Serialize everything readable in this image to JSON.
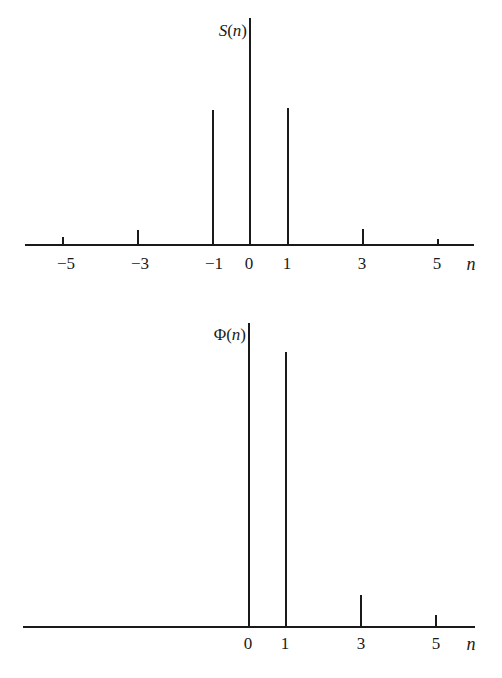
{
  "chart_data": [
    {
      "type": "bar",
      "subtype": "stem",
      "title": "",
      "ylabel": "S(n)",
      "xlabel": "n",
      "x": [
        -5,
        -3,
        -1,
        0,
        1,
        3,
        5
      ],
      "values": [
        0.035,
        0.066,
        0.6,
        1.0,
        0.6,
        0.07,
        0.027
      ],
      "tick_labels": [
        "−5",
        "−3",
        "−1",
        "0",
        "1",
        "3",
        "5"
      ],
      "xlim": [
        -6.0,
        5.9
      ],
      "ylim": [
        0,
        1
      ],
      "grid": false,
      "legend": null
    },
    {
      "type": "bar",
      "subtype": "stem",
      "title": "",
      "ylabel": "Φ(n)",
      "xlabel": "n",
      "x": [
        0,
        1,
        3,
        5
      ],
      "values": [
        1.0,
        0.9,
        0.105,
        0.04
      ],
      "tick_labels": [
        "0",
        "1",
        "3",
        "5"
      ],
      "xlim": [
        -6.0,
        5.9
      ],
      "ylim": [
        0,
        1
      ],
      "grid": false,
      "legend": null
    }
  ],
  "charts": [
    {
      "ylabel_main": "S",
      "ylabel_arg": "(n)",
      "xlabel": "n",
      "axis": {
        "x1": 25,
        "x2": 474,
        "y": 245
      },
      "ylabel_pos": {
        "x": 247,
        "y": 36
      },
      "stems": [
        {
          "x": 63,
          "top": 237,
          "label": "−5",
          "lx": 66
        },
        {
          "x": 138,
          "top": 230,
          "label": "−3",
          "lx": 140
        },
        {
          "x": 213,
          "top": 110,
          "label": "−1",
          "lx": 214
        },
        {
          "x": 250,
          "top": 18,
          "label": "0",
          "lx": 249
        },
        {
          "x": 288,
          "top": 108,
          "label": "1",
          "lx": 287
        },
        {
          "x": 363,
          "top": 229,
          "label": "3",
          "lx": 362
        },
        {
          "x": 438,
          "top": 239,
          "label": "5",
          "lx": 437
        }
      ],
      "label_y": 269,
      "n_pos": {
        "x": 471,
        "y": 270
      }
    },
    {
      "ylabel_main": "Φ",
      "ylabel_arg": "(n)",
      "xlabel": "n",
      "axis": {
        "x1": 23,
        "x2": 475,
        "y": 627
      },
      "ylabel_pos": {
        "x": 246,
        "y": 340
      },
      "stems": [
        {
          "x": 249,
          "top": 323,
          "label": "0",
          "lx": 248
        },
        {
          "x": 286,
          "top": 352,
          "label": "1",
          "lx": 285
        },
        {
          "x": 361,
          "top": 595,
          "label": "3",
          "lx": 361
        },
        {
          "x": 436,
          "top": 615,
          "label": "5",
          "lx": 436
        }
      ],
      "label_y": 649,
      "n_pos": {
        "x": 471,
        "y": 650
      }
    }
  ],
  "colors": {
    "ink": "#1a1a1a",
    "background": "#ffffff"
  }
}
